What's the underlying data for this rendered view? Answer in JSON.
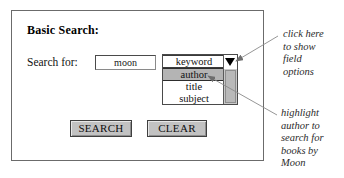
{
  "app": {
    "title": "Basic Search form annotated diagram"
  },
  "panel": {
    "heading": "Basic Search:",
    "field_label": "Search for:",
    "search_input": {
      "value": "moon",
      "placeholder": "",
      "name": "search-input"
    },
    "field_select": {
      "selected_value": "keyword",
      "highlighted_value": "author",
      "options": [
        {
          "label": "keyword",
          "state": "current"
        },
        {
          "label": "author",
          "state": "highlighted"
        },
        {
          "label": "title",
          "state": "normal"
        },
        {
          "label": "subject",
          "state": "normal"
        }
      ],
      "dropdown_arrow_icon": "triangle-down-icon",
      "scrollbar_icon": "vertical-scrollbar"
    },
    "buttons": {
      "search_label": "SEARCH",
      "clear_label": "CLEAR"
    }
  },
  "annotations": [
    {
      "id": "callout-dropdown-arrow",
      "lines": [
        "click here",
        "to show",
        "field",
        "options"
      ],
      "points_to": "dropdown-arrow-button"
    },
    {
      "id": "callout-author-option",
      "lines": [
        "highlight",
        "author to",
        "search for",
        "books by",
        "Moon"
      ],
      "points_to": "dropdown-option-author"
    }
  ],
  "colors": {
    "page_background": "#ffffff",
    "panel_border": "#6b6b6b",
    "button_face": "#c2c2c2",
    "selection_highlight": "#b4b4b4",
    "scrollbar_track": "#c9c9c9",
    "scrollbar_thumb": "#b9b9b9",
    "text": "#111111",
    "annotation_text": "#2b2b2b",
    "leader_line": "#8a8a8a"
  }
}
